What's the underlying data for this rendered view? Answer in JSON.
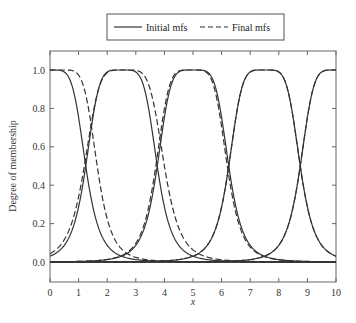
{
  "chart_data": {
    "type": "line",
    "title": "",
    "xlabel": "x",
    "ylabel": "Degree of membership",
    "xlim": [
      0,
      10
    ],
    "ylim": [
      -0.1,
      1.1
    ],
    "x_ticks": [
      "0",
      "1",
      "2",
      "3",
      "4",
      "5",
      "6",
      "7",
      "8",
      "9",
      "10"
    ],
    "y_ticks": [
      "0.0",
      "0.2",
      "0.4",
      "0.6",
      "0.8",
      "1.0"
    ],
    "grid": false,
    "legend": {
      "position": "top-center-outside",
      "entries": [
        {
          "label": "Initial mfs",
          "style": "solid"
        },
        {
          "label": "Final mfs",
          "style": "dashed"
        }
      ]
    },
    "mf_shape": "generalized bell (a, b, c)",
    "series": [
      {
        "name": "Initial mf 1",
        "style": "solid",
        "a": 1.25,
        "b": 2.5,
        "c": 0.0
      },
      {
        "name": "Initial mf 2",
        "style": "solid",
        "a": 1.25,
        "b": 2.5,
        "c": 2.5
      },
      {
        "name": "Initial mf 3",
        "style": "solid",
        "a": 1.25,
        "b": 2.5,
        "c": 5.0
      },
      {
        "name": "Initial mf 4",
        "style": "solid",
        "a": 1.25,
        "b": 2.5,
        "c": 7.5
      },
      {
        "name": "Initial mf 5",
        "style": "solid",
        "a": 1.25,
        "b": 2.5,
        "c": 10.0
      },
      {
        "name": "Final mf 1",
        "style": "dashed",
        "a": 1.3,
        "b": 2.6,
        "c": 0.35
      },
      {
        "name": "Final mf 2",
        "style": "dashed",
        "a": 1.4,
        "b": 2.5,
        "c": 2.6
      },
      {
        "name": "Final mf 3",
        "style": "dashed",
        "a": 1.25,
        "b": 2.5,
        "c": 4.95
      },
      {
        "name": "Final mf 4",
        "style": "dashed",
        "a": 1.25,
        "b": 2.5,
        "c": 7.5
      },
      {
        "name": "Final mf 5",
        "style": "dashed",
        "a": 1.25,
        "b": 2.5,
        "c": 10.0
      }
    ],
    "annotations": [
      "Crossovers near y≈0.55 at x≈1.3, 3.7, 6.2, 8.7"
    ]
  }
}
